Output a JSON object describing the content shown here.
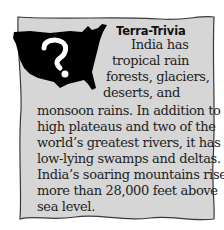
{
  "sidebar_box": {
    "title": "Terra-Trivia",
    "icon": "question-mark-map-icon",
    "body_lines": [
      "India has",
      "tropical rain",
      "forests, glaciers,",
      "deserts, and",
      "monsoon rains. In addition to",
      "high plateaus and two of the",
      "world’s greatest rivers, it has",
      "low-lying swamps and deltas.",
      "India’s soaring mountains rise",
      "more than 28,000 feet above",
      "sea level."
    ]
  },
  "colors": {
    "paper": "#d6d6d6",
    "border": "#3a3a3a",
    "map": "#000000",
    "text": "#222222"
  }
}
